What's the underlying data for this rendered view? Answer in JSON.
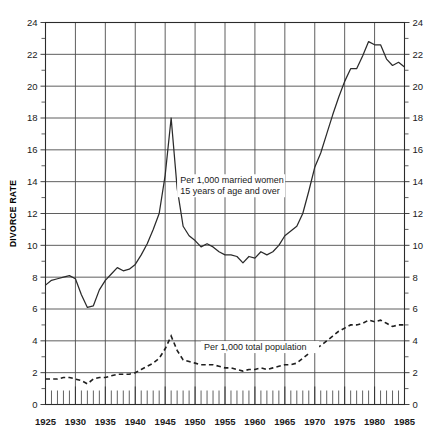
{
  "chart_data": {
    "type": "line",
    "title": "",
    "xlabel": "",
    "ylabel": "DIVORCE RATE",
    "xlim": [
      1925,
      1985
    ],
    "ylim": [
      0,
      24
    ],
    "grid": true,
    "legend": "inline-annotations",
    "x_ticks": [
      1925,
      1930,
      1935,
      1940,
      1945,
      1950,
      1955,
      1960,
      1965,
      1970,
      1975,
      1980,
      1985
    ],
    "y_ticks": [
      0,
      2,
      4,
      6,
      8,
      10,
      12,
      14,
      16,
      18,
      20,
      22,
      24
    ],
    "y_minor_ticks": [
      1,
      3,
      5,
      7,
      9,
      11,
      13,
      15,
      17,
      19,
      21,
      23
    ],
    "x_minor_tick_interval": 1,
    "x": [
      1925,
      1926,
      1927,
      1928,
      1929,
      1930,
      1931,
      1932,
      1933,
      1934,
      1935,
      1936,
      1937,
      1938,
      1939,
      1940,
      1941,
      1942,
      1943,
      1944,
      1945,
      1946,
      1947,
      1948,
      1949,
      1950,
      1951,
      1952,
      1953,
      1954,
      1955,
      1956,
      1957,
      1958,
      1959,
      1960,
      1961,
      1962,
      1963,
      1964,
      1965,
      1966,
      1967,
      1968,
      1969,
      1970,
      1971,
      1972,
      1973,
      1974,
      1975,
      1976,
      1977,
      1978,
      1979,
      1980,
      1981,
      1982,
      1983,
      1984,
      1985
    ],
    "series": [
      {
        "name": "Per 1,000 married women 15 years of age and over",
        "style": "solid",
        "annotation": "Per 1,000 married women\n15 years of age and over",
        "values": [
          7.5,
          7.8,
          7.9,
          8.0,
          8.1,
          7.9,
          6.9,
          6.1,
          6.2,
          7.2,
          7.8,
          8.2,
          8.6,
          8.4,
          8.5,
          8.8,
          9.4,
          10.1,
          11.0,
          12.0,
          14.4,
          18.0,
          13.6,
          11.2,
          10.6,
          10.3,
          9.9,
          10.1,
          9.9,
          9.6,
          9.4,
          9.4,
          9.3,
          8.9,
          9.3,
          9.2,
          9.6,
          9.4,
          9.6,
          10.0,
          10.6,
          10.9,
          11.2,
          12.0,
          13.4,
          14.9,
          15.8,
          17.0,
          18.2,
          19.3,
          20.3,
          21.1,
          21.1,
          21.9,
          22.8,
          22.6,
          22.6,
          21.7,
          21.3,
          21.5,
          21.2
        ]
      },
      {
        "name": "Per 1,000 total population",
        "style": "dashed",
        "annotation": "Per 1,000 total population",
        "values": [
          1.6,
          1.6,
          1.6,
          1.7,
          1.7,
          1.6,
          1.5,
          1.3,
          1.6,
          1.7,
          1.7,
          1.8,
          1.9,
          1.9,
          1.9,
          2.0,
          2.2,
          2.4,
          2.6,
          2.9,
          3.5,
          4.3,
          3.4,
          2.8,
          2.7,
          2.6,
          2.5,
          2.5,
          2.5,
          2.4,
          2.3,
          2.3,
          2.2,
          2.1,
          2.2,
          2.2,
          2.3,
          2.2,
          2.3,
          2.4,
          2.5,
          2.5,
          2.6,
          2.9,
          3.2,
          3.5,
          3.7,
          4.0,
          4.3,
          4.6,
          4.8,
          5.0,
          5.0,
          5.1,
          5.3,
          5.2,
          5.3,
          5.1,
          4.9,
          5.0,
          5.0
        ]
      }
    ]
  },
  "axes": {
    "y_title": "DIVORCE RATE",
    "y_labels": [
      "0",
      "2",
      "4",
      "6",
      "8",
      "10",
      "12",
      "14",
      "16",
      "18",
      "20",
      "22",
      "24"
    ],
    "x_labels": [
      "1925",
      "1930",
      "1935",
      "1940",
      "1945",
      "1950",
      "1955",
      "1960",
      "1965",
      "1970",
      "1975",
      "1980",
      "1985"
    ]
  },
  "annotations": {
    "married_women_line1": "Per 1,000 married women",
    "married_women_line2": "15 years of age and over",
    "total_population": "Per 1,000 total population"
  },
  "colors": {
    "line": "#2b2b2b",
    "grid": "#4d4d4d",
    "background": "#ffffff",
    "text": "#1a1a1a"
  }
}
